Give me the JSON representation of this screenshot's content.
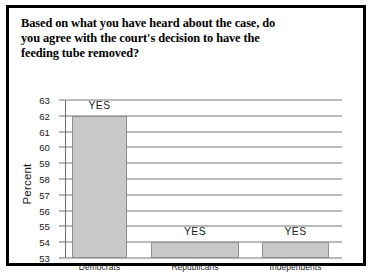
{
  "chart_data": {
    "type": "bar",
    "title": "Based on what you have heard about the case, do you agree with the court's decision to have the feeding tube removed?",
    "title_lines": [
      "Based on what you have heard about the case, do",
      "you agree with the court's decision to have the",
      "feeding tube removed?"
    ],
    "categories": [
      "Democrats",
      "Republicans",
      "Independents"
    ],
    "values": [
      62,
      54,
      54
    ],
    "point_labels": [
      "YES",
      "YES",
      "YES"
    ],
    "xlabel": "",
    "ylabel": "Percent",
    "ylim": [
      53,
      63
    ],
    "yticks": [
      63,
      62,
      61,
      60,
      59,
      58,
      57,
      56,
      55,
      54,
      53
    ],
    "grid": true,
    "legend": false,
    "bar_color": "#c9c9c9",
    "bar_border_color": "#8f8f8f",
    "frame_color": "#000000",
    "text_color": "#1a1a1a"
  }
}
